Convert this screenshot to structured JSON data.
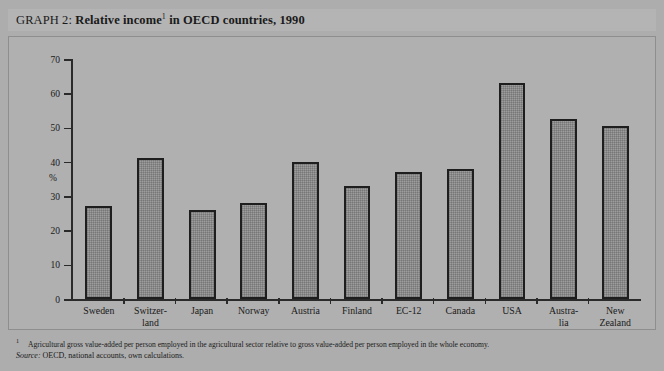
{
  "figure": {
    "label": "GRAPH 2:",
    "title_bold": "Relative income",
    "title_superscript": "1",
    "title_rest": " in OECD countries, 1990"
  },
  "axis": {
    "unit": "%",
    "ticks": [
      "0",
      "10",
      "20",
      "30",
      "40",
      "50",
      "60",
      "70"
    ]
  },
  "footnotes": {
    "marker": "1",
    "note": "Agricultural gross value-added per person employed in the agricultural sector relative to gross value-added per person employed in the whole economy.",
    "source_label": "Source:",
    "source_text": " OECD, national accounts, own calculations."
  },
  "chart_data": {
    "type": "bar",
    "xlabel": "",
    "ylabel": "%",
    "ylim": [
      0,
      70
    ],
    "ytick_step": 10,
    "grid": false,
    "legend": "none",
    "categories": [
      "Sweden",
      "Switzer-\nland",
      "Japan",
      "Norway",
      "Austria",
      "Finland",
      "EC-12",
      "Canada",
      "USA",
      "Austra-\nlia",
      "New\nZealand"
    ],
    "values": [
      27,
      41,
      26,
      28,
      40,
      33,
      37,
      38,
      63,
      52.5,
      50.5
    ]
  },
  "colors": {
    "page_background": "#adadad",
    "panel_background": "#b0b0b0",
    "title_band": "#b4b4b4",
    "bar_fill": "#9d9d9d",
    "bar_border": "#1e1e1e",
    "axis": "#2a2a2a",
    "text": "#1a1a1a"
  }
}
